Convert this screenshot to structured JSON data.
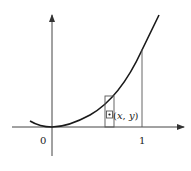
{
  "diagram": {
    "type": "function-graph",
    "labels": {
      "origin": "0",
      "x_tick_one": "1",
      "point_open": "(",
      "point_x": "x",
      "point_sep": ", ",
      "point_y": "y",
      "point_close": ")"
    },
    "elements": [
      "x-axis with arrow",
      "y-axis with arrow",
      "parabola-like curve through origin",
      "vertical line at x = 1 up to curve",
      "thin vertical strip rectangle under curve",
      "small square with center dot marking point (x, y)"
    ],
    "colors": {
      "curve": "#1a1a1a",
      "axis": "#444444",
      "background": "#ffffff"
    }
  }
}
